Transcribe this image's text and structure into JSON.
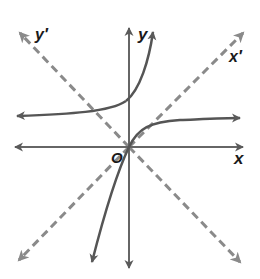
{
  "diagram": {
    "type": "rotated-coordinate-axes-with-curves",
    "colors": {
      "axis": "#666666",
      "curve": "#555555",
      "dashed_axis": "#8a8a8a",
      "label": "#1a1a1a",
      "background": "#ffffff"
    },
    "labels": {
      "x_axis": "x",
      "y_axis": "y",
      "x_prime_axis": "x′",
      "y_prime_axis": "y′",
      "origin": "O"
    },
    "axes": [
      {
        "name": "x",
        "style": "solid",
        "direction": "horizontal",
        "arrows": "both"
      },
      {
        "name": "y",
        "style": "solid",
        "direction": "vertical",
        "arrows": "both"
      },
      {
        "name": "x′",
        "style": "dashed",
        "direction": "diagonal-up-right",
        "arrows": "both"
      },
      {
        "name": "y′",
        "style": "dashed",
        "direction": "diagonal-up-left",
        "arrows": "both"
      }
    ],
    "curves": [
      {
        "name": "upper-curve",
        "description": "approaches horizontal asymptote to the left, rises steeply upward crossing the y-axis above origin",
        "arrows": "both"
      },
      {
        "name": "origin-curve",
        "description": "passes through origin, rises steeply from lower-left, levels off toward right",
        "arrows": "both"
      }
    ]
  }
}
